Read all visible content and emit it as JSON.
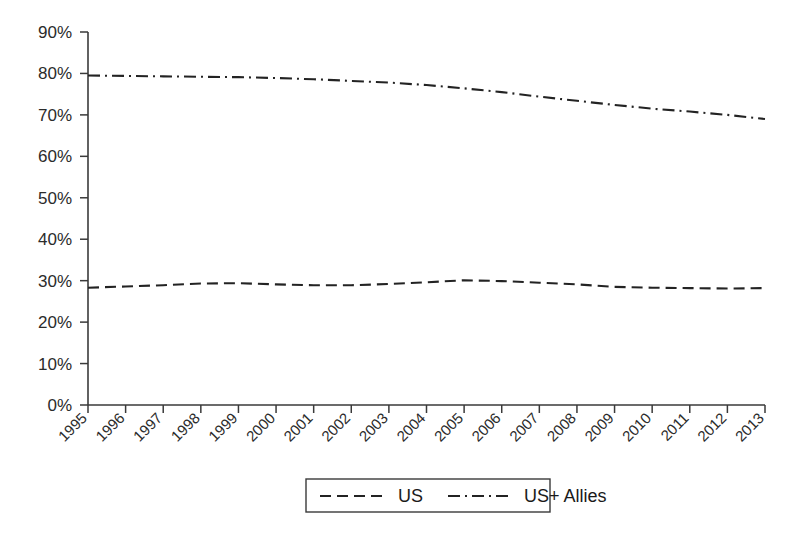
{
  "chart_data": {
    "type": "line",
    "title": "",
    "subtitle": "",
    "xlabel": "",
    "ylabel": "",
    "grid": false,
    "legend_position": "bottom-center",
    "ylim": [
      0,
      90
    ],
    "ytick_labels": [
      "0%",
      "10%",
      "20%",
      "30%",
      "40%",
      "50%",
      "60%",
      "70%",
      "80%",
      "90%"
    ],
    "ytick_values": [
      0,
      10,
      20,
      30,
      40,
      50,
      60,
      70,
      80,
      90
    ],
    "categories": [
      "1995",
      "1996",
      "1997",
      "1998",
      "1999",
      "2000",
      "2001",
      "2002",
      "2003",
      "2004",
      "2005",
      "2006",
      "2007",
      "2008",
      "2009",
      "2010",
      "2011",
      "2012",
      "2013"
    ],
    "x": [
      1995,
      1996,
      1997,
      1998,
      1999,
      2000,
      2001,
      2002,
      2003,
      2004,
      2005,
      2006,
      2007,
      2008,
      2009,
      2010,
      2011,
      2012,
      2013
    ],
    "series": [
      {
        "name": "US",
        "style": "dashed",
        "color": "#232323",
        "values": [
          28.3,
          28.6,
          28.9,
          29.3,
          29.4,
          29.1,
          28.9,
          28.9,
          29.2,
          29.6,
          30.1,
          29.9,
          29.5,
          29.1,
          28.5,
          28.3,
          28.2,
          28.1,
          28.2
        ]
      },
      {
        "name": "US+ Allies",
        "style": "dash-dot",
        "color": "#232323",
        "values": [
          79.5,
          79.4,
          79.3,
          79.2,
          79.1,
          78.9,
          78.6,
          78.2,
          77.8,
          77.2,
          76.4,
          75.5,
          74.4,
          73.4,
          72.4,
          71.5,
          70.8,
          70.0,
          69.0
        ]
      }
    ]
  },
  "legend": {
    "items": [
      {
        "label": "US",
        "style": "dashed"
      },
      {
        "label": "US+ Allies",
        "style": "dash-dot"
      }
    ]
  }
}
